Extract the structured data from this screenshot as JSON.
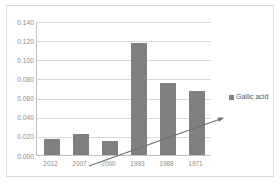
{
  "chart_data": {
    "type": "bar",
    "title": "",
    "subtitle": "",
    "xlabel": "",
    "ylabel": "",
    "categories": [
      "2012",
      "2007",
      "2000",
      "1993",
      "1988",
      "1971"
    ],
    "series": [
      {
        "name": "Gallic acid",
        "color": "#808080",
        "values": [
          0.017,
          0.022,
          0.015,
          0.117,
          0.075,
          0.067
        ]
      }
    ],
    "ylim": [
      0.0,
      0.14
    ],
    "ytick_labels": [
      "0.140",
      "0.120",
      "0.100",
      "0.080",
      "0.060",
      "0.040",
      "0.020",
      "0.000"
    ],
    "ytick_values": [
      0.14,
      0.12,
      0.1,
      0.08,
      0.06,
      0.04,
      0.02,
      0.0
    ],
    "grid": true,
    "legend": {
      "position": "right",
      "entries": [
        {
          "label": "Gallic acid",
          "color": "#808080",
          "marker": "square"
        }
      ]
    },
    "annotations": [
      {
        "type": "trend-arrow",
        "description": "upward diagonal arrow from lower-left to upper-right",
        "color": "#6e6e6e"
      }
    ]
  }
}
